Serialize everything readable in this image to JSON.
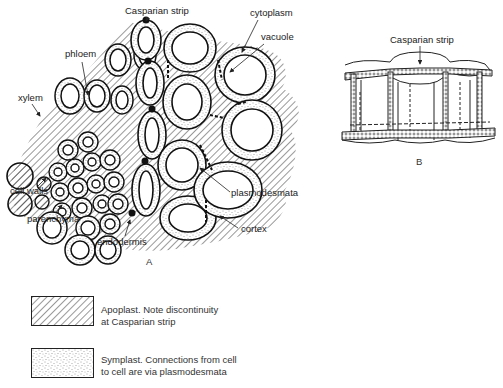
{
  "panel_a": {
    "labels": {
      "casparian_strip": "Casparian strip",
      "phloem": "phloem",
      "cytoplasm": "cytoplasm",
      "vacuole": "vacuole",
      "xylem": "xylem",
      "cell_walls": "cell walls",
      "parenchyma": "parenchyma",
      "plasmodesmata": "plasmodesmata",
      "endodermis": "endodermis",
      "cortex": "cortex"
    },
    "caption": "A"
  },
  "panel_b": {
    "labels": {
      "casparian_strip": "Casparian strip"
    },
    "caption": "B"
  },
  "legend": {
    "items": [
      {
        "pattern": "hatched",
        "line1": "Apoplast.  Note discontinuity",
        "line2": "at Casparian strip"
      },
      {
        "pattern": "stippled",
        "line1": "Symplast.  Connections from cell",
        "line2": "to cell are via plasmodesmata"
      }
    ]
  }
}
